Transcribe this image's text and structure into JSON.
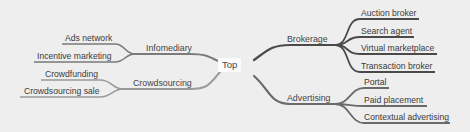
{
  "diagram": {
    "type": "mind-map",
    "root": "Top",
    "colors": {
      "background": "#eeeeee",
      "right_branch_line": "#4a4a4a",
      "left_branch_line": "#8a8a8a",
      "text": "#3a3a3a"
    },
    "right": [
      {
        "label": "Brokerage",
        "children": [
          "Auction broker",
          "Search agent",
          "Virtual marketplace",
          "Transaction broker"
        ]
      },
      {
        "label": "Advertising",
        "children": [
          "Portal",
          "Paid placement",
          "Contextual advertising"
        ]
      }
    ],
    "left": [
      {
        "label": "Infomediary",
        "children": [
          "Ads network",
          "Incentive marketing"
        ]
      },
      {
        "label": "Crowdsourcing",
        "children": [
          "Crowdfunding",
          "Crowdsourcing sale"
        ]
      }
    ]
  }
}
